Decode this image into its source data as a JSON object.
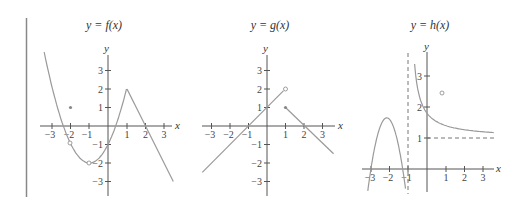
{
  "chart_data": [
    {
      "type": "line",
      "title": "y = f(x)",
      "xlabel": "x",
      "ylabel": "y",
      "x_ticks": [
        -3,
        -2,
        -1,
        1,
        2,
        3
      ],
      "y_ticks": [
        -3,
        -2,
        -1,
        1,
        2,
        3
      ],
      "xlim": [
        -3.5,
        3.5
      ],
      "ylim": [
        -3.5,
        3.5
      ],
      "series": [
        {
          "name": "parabola piece",
          "formula": "(x+1)^2 - 2",
          "domain": [
            -3.45,
            1
          ],
          "x": [
            -3.45,
            -3,
            -2.41,
            -2,
            -1,
            0,
            0.41,
            1
          ],
          "values": [
            3.8,
            2,
            0,
            -1,
            -2,
            -1,
            0,
            2
          ]
        },
        {
          "name": "linear piece",
          "domain": [
            1,
            3.5
          ],
          "x": [
            1,
            2,
            3.5
          ],
          "values": [
            2,
            0,
            -3
          ]
        }
      ],
      "points": [
        {
          "x": -2,
          "y": 1,
          "style": "filled"
        },
        {
          "x": -2,
          "y": -1,
          "style": "open"
        },
        {
          "x": -1,
          "y": -2,
          "style": "open"
        }
      ],
      "grid": false
    },
    {
      "type": "line",
      "title": "y = g(x)",
      "xlabel": "x",
      "ylabel": "y",
      "x_ticks": [
        -3,
        -2,
        -1,
        1,
        2,
        3
      ],
      "y_ticks": [
        -3,
        -2,
        -1,
        1,
        2,
        3
      ],
      "xlim": [
        -3.5,
        3.5
      ],
      "ylim": [
        -3.5,
        3.5
      ],
      "series": [
        {
          "name": "left line",
          "x": [
            -3.5,
            -1,
            0,
            1
          ],
          "values": [
            -2.5,
            0,
            1,
            2
          ]
        },
        {
          "name": "right line",
          "x": [
            1,
            2,
            3.5
          ],
          "values": [
            1,
            0,
            -1.5
          ]
        }
      ],
      "points": [
        {
          "x": 1,
          "y": 2,
          "style": "open"
        },
        {
          "x": 1,
          "y": 1,
          "style": "filled"
        }
      ],
      "grid": false
    },
    {
      "type": "line",
      "title": "y = h(x)",
      "xlabel": "x",
      "ylabel": "y",
      "x_ticks": [
        -3,
        -2,
        -1,
        1,
        2,
        3
      ],
      "y_ticks": [
        1,
        2,
        3
      ],
      "xlim": [
        -3.5,
        3.7
      ],
      "ylim": [
        -0.8,
        3.8
      ],
      "series": [
        {
          "name": "left branch",
          "x": [
            -3.2,
            -3,
            -1.8,
            -1.3,
            -1.15
          ],
          "values": [
            -0.7,
            0,
            1.65,
            0,
            -0.7
          ]
        },
        {
          "name": "right branch",
          "formula": "1 + 0.8/(x+1)",
          "x": [
            -0.78,
            0,
            1,
            2,
            3.5
          ],
          "values": [
            4.6,
            1.8,
            1.4,
            1.27,
            1.18
          ]
        }
      ],
      "asymptotes": [
        {
          "type": "vertical",
          "x": -1,
          "style": "dashed"
        },
        {
          "type": "horizontal",
          "y": 1,
          "style": "dashed"
        }
      ],
      "points": [
        {
          "x": 0.8,
          "y": 2.5,
          "style": "open"
        }
      ],
      "grid": false
    }
  ],
  "labels": {
    "f_title": "y = f(x)",
    "g_title": "y = g(x)",
    "h_title": "y = h(x)",
    "x": "x",
    "y": "y",
    "n3": "3",
    "n2": "2",
    "n1": "1",
    "m1": "−1",
    "m2": "−2",
    "m3": "−3"
  },
  "colors": {
    "curve": "#9a9a9a",
    "axis": "#555555",
    "border": "#888888"
  }
}
